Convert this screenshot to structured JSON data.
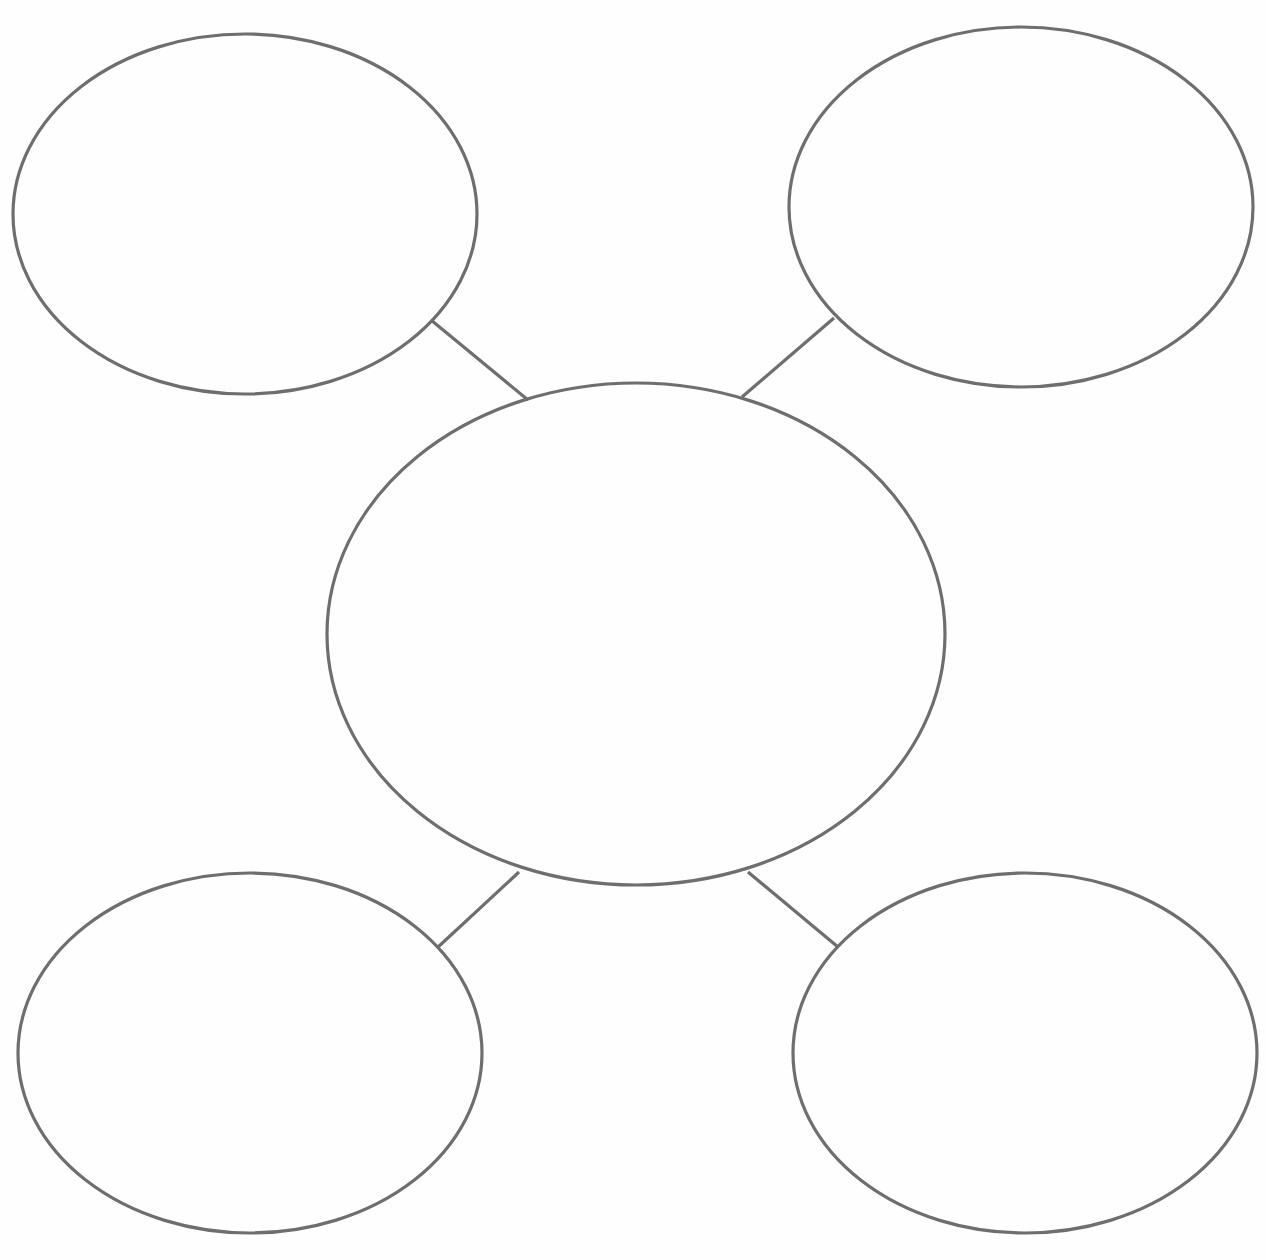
{
  "document": {
    "title": "Concept Web Graphic Organizer",
    "type": "blank-concept-map",
    "background_color": "#fefefe",
    "stroke_color": "#6e6e6e",
    "stroke_width": 3.2,
    "canvas": {
      "width": 1266,
      "height": 1260
    }
  },
  "nodes": {
    "center": {
      "id": "center-node",
      "label": "",
      "shape": "circle",
      "cx": 636,
      "cy": 634,
      "rx": 309,
      "ry": 251
    },
    "satellites": [
      {
        "id": "satellite-top-left",
        "label": "",
        "shape": "ellipse",
        "position": "top-left",
        "cx": 245,
        "cy": 214,
        "rx": 232,
        "ry": 180
      },
      {
        "id": "satellite-top-right",
        "label": "",
        "shape": "ellipse",
        "position": "top-right",
        "cx": 1021,
        "cy": 207,
        "rx": 232,
        "ry": 180
      },
      {
        "id": "satellite-bottom-left",
        "label": "",
        "shape": "ellipse",
        "position": "bottom-left",
        "cx": 250,
        "cy": 1053,
        "rx": 232,
        "ry": 180
      },
      {
        "id": "satellite-bottom-right",
        "label": "",
        "shape": "ellipse",
        "position": "bottom-right",
        "cx": 1025,
        "cy": 1053,
        "rx": 232,
        "ry": 180
      }
    ]
  },
  "connectors": [
    {
      "id": "connector-center-top-left",
      "from": "satellite-top-left",
      "to": "center-node",
      "x1": 431,
      "y1": 320,
      "x2": 528,
      "y2": 400
    },
    {
      "id": "connector-center-top-right",
      "from": "satellite-top-right",
      "to": "center-node",
      "x1": 834,
      "y1": 318,
      "x2": 742,
      "y2": 397
    },
    {
      "id": "connector-center-bottom-left",
      "from": "center-node",
      "to": "satellite-bottom-left",
      "x1": 519,
      "y1": 872,
      "x2": 437,
      "y2": 948
    },
    {
      "id": "connector-center-bottom-right",
      "from": "center-node",
      "to": "satellite-bottom-right",
      "x1": 748,
      "y1": 872,
      "x2": 838,
      "y2": 947
    }
  ]
}
